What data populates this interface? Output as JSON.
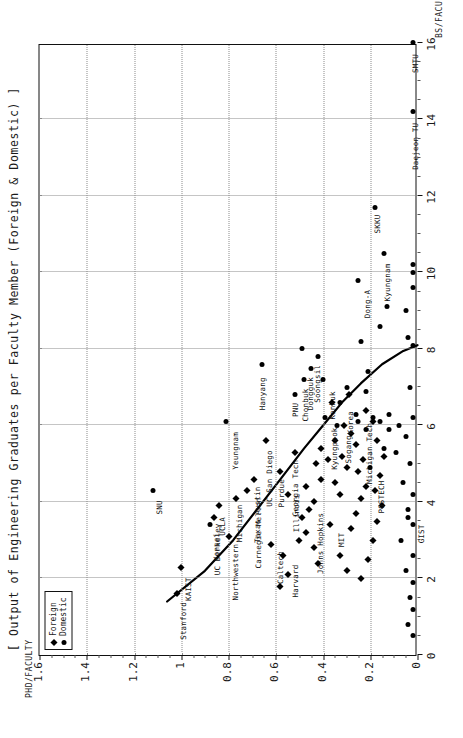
{
  "title": "[ Output of Engineering Graduates per Faculty Member (Foreign & Domestic) ]",
  "legend": {
    "position": "top-left",
    "items": [
      {
        "label": "Foreign",
        "marker": "diamond"
      },
      {
        "label": "Domestic",
        "marker": "circle"
      }
    ]
  },
  "axes": {
    "x_title": "BS/FACULTY",
    "y_title": "PHD/FACULTY",
    "x_ticks": [
      "0",
      "2",
      "4",
      "6",
      "8",
      "10",
      "12",
      "14",
      "16"
    ],
    "y_ticks": [
      "0",
      "0.2",
      "0.4",
      "0.6",
      "0.8",
      "1",
      "1.2",
      "1.4",
      "1.6"
    ]
  },
  "chart_data": {
    "type": "scatter",
    "title": "[ Output of Engineering Graduates per Faculty Member (Foreign & Domestic) ]",
    "xlabel": "BS/FACULTY",
    "ylabel": "PHD/FACULTY",
    "xlim": [
      0,
      16
    ],
    "ylim": [
      0,
      1.6
    ],
    "grid": true,
    "legend_position": "top-left",
    "series": [
      {
        "name": "Foreign",
        "marker": "diamond",
        "points": [
          {
            "label": "Stanford",
            "x": 1.6,
            "y": 1.02
          },
          {
            "label": "KAIST",
            "x": 2.3,
            "y": 1.0
          },
          {
            "label": "Northwestern",
            "x": 3.1,
            "y": 0.8
          },
          {
            "label": "UC Berkeley",
            "x": 3.6,
            "y": 0.86
          },
          {
            "label": "UCLA",
            "x": 3.9,
            "y": 0.84
          },
          {
            "label": "Michigan",
            "x": 4.1,
            "y": 0.77
          },
          {
            "label": "Carnegie Mellon",
            "x": 4.3,
            "y": 0.72
          },
          {
            "label": "Caltech",
            "x": 2.9,
            "y": 0.62
          },
          {
            "label": "Harvard",
            "x": 2.6,
            "y": 0.57
          },
          {
            "label": "Texas Austin",
            "x": 4.6,
            "y": 0.69
          },
          {
            "label": "Illinois",
            "x": 4.2,
            "y": 0.55
          },
          {
            "label": "Purdue",
            "x": 4.8,
            "y": 0.58
          },
          {
            "label": "Georgia Tech",
            "x": 5.3,
            "y": 0.52
          },
          {
            "label": "Johns Hopkins",
            "x": 4.0,
            "y": 0.44
          },
          {
            "label": "MIT",
            "x": 3.4,
            "y": 0.37
          },
          {
            "label": "UC San Diego",
            "x": 5.6,
            "y": 0.64
          },
          {
            "label": "",
            "x": 3.0,
            "y": 0.5
          },
          {
            "label": "",
            "x": 3.2,
            "y": 0.47
          },
          {
            "label": "",
            "x": 3.6,
            "y": 0.49
          },
          {
            "label": "",
            "x": 3.8,
            "y": 0.46
          },
          {
            "label": "",
            "x": 4.4,
            "y": 0.47
          },
          {
            "label": "",
            "x": 4.6,
            "y": 0.41
          },
          {
            "label": "",
            "x": 5.0,
            "y": 0.43
          },
          {
            "label": "",
            "x": 5.1,
            "y": 0.38
          },
          {
            "label": "",
            "x": 5.4,
            "y": 0.41
          },
          {
            "label": "",
            "x": 4.2,
            "y": 0.33
          },
          {
            "label": "",
            "x": 4.5,
            "y": 0.35
          },
          {
            "label": "",
            "x": 4.9,
            "y": 0.3
          },
          {
            "label": "",
            "x": 5.2,
            "y": 0.32
          },
          {
            "label": "",
            "x": 5.6,
            "y": 0.35
          },
          {
            "label": "",
            "x": 2.8,
            "y": 0.44
          },
          {
            "label": "",
            "x": 2.4,
            "y": 0.42
          },
          {
            "label": "",
            "x": 3.3,
            "y": 0.28
          },
          {
            "label": "",
            "x": 3.7,
            "y": 0.26
          },
          {
            "label": "",
            "x": 4.1,
            "y": 0.24
          },
          {
            "label": "",
            "x": 4.4,
            "y": 0.22
          },
          {
            "label": "",
            "x": 4.8,
            "y": 0.25
          },
          {
            "label": "",
            "x": 5.1,
            "y": 0.23
          },
          {
            "label": "",
            "x": 5.5,
            "y": 0.26
          },
          {
            "label": "",
            "x": 5.8,
            "y": 0.28
          },
          {
            "label": "",
            "x": 6.0,
            "y": 0.31
          },
          {
            "label": "",
            "x": 2.2,
            "y": 0.3
          },
          {
            "label": "",
            "x": 2.6,
            "y": 0.33
          },
          {
            "label": "",
            "x": 2.0,
            "y": 0.24
          },
          {
            "label": "",
            "x": 2.5,
            "y": 0.21
          },
          {
            "label": "",
            "x": 3.0,
            "y": 0.19
          },
          {
            "label": "",
            "x": 3.5,
            "y": 0.17
          },
          {
            "label": "",
            "x": 3.9,
            "y": 0.15
          },
          {
            "label": "",
            "x": 4.3,
            "y": 0.18
          },
          {
            "label": "",
            "x": 4.7,
            "y": 0.16
          },
          {
            "label": "",
            "x": 5.2,
            "y": 0.14
          },
          {
            "label": "",
            "x": 5.6,
            "y": 0.17
          },
          {
            "label": "",
            "x": 6.1,
            "y": 0.19
          },
          {
            "label": "",
            "x": 6.4,
            "y": 0.22
          },
          {
            "label": "",
            "x": 1.8,
            "y": 0.58
          },
          {
            "label": "",
            "x": 2.1,
            "y": 0.55
          },
          {
            "label": "",
            "x": 6.6,
            "y": 0.36
          },
          {
            "label": "",
            "x": 6.8,
            "y": 0.29
          }
        ]
      },
      {
        "name": "Domestic",
        "marker": "circle",
        "points": [
          {
            "label": "SNU",
            "x": 4.3,
            "y": 1.12
          },
          {
            "label": "Yonsei",
            "x": 3.4,
            "y": 0.88
          },
          {
            "label": "Yeungnam",
            "x": 6.1,
            "y": 0.81
          },
          {
            "label": "Hanyang",
            "x": 7.6,
            "y": 0.66
          },
          {
            "label": "PNU",
            "x": 6.8,
            "y": 0.52
          },
          {
            "label": "Chonbuk",
            "x": 7.2,
            "y": 0.48
          },
          {
            "label": "Dongguk",
            "x": 7.5,
            "y": 0.45
          },
          {
            "label": "Soongsil",
            "x": 7.8,
            "y": 0.42
          },
          {
            "label": "Konkuk",
            "x": 7.2,
            "y": 0.4
          },
          {
            "label": "Kyungpook",
            "x": 6.2,
            "y": 0.39
          },
          {
            "label": "Sogang",
            "x": 6.0,
            "y": 0.34
          },
          {
            "label": "Korea",
            "x": 6.6,
            "y": 0.33
          },
          {
            "label": "Michigan Tech",
            "x": 6.3,
            "y": 0.26
          },
          {
            "label": "SKKU",
            "x": 11.7,
            "y": 0.18
          },
          {
            "label": "Dong-A",
            "x": 9.8,
            "y": 0.25
          },
          {
            "label": "Kyungnam",
            "x": 10.5,
            "y": 0.14
          },
          {
            "label": "Daejeon TU",
            "x": 14.2,
            "y": 0.02
          },
          {
            "label": "SMTU",
            "x": 16.0,
            "y": 0.02
          },
          {
            "label": "",
            "x": 8.0,
            "y": 0.49
          },
          {
            "label": "",
            "x": 7.0,
            "y": 0.3
          },
          {
            "label": "",
            "x": 6.9,
            "y": 0.22
          },
          {
            "label": "",
            "x": 7.4,
            "y": 0.21
          },
          {
            "label": "",
            "x": 8.2,
            "y": 0.24
          },
          {
            "label": "",
            "x": 8.6,
            "y": 0.16
          },
          {
            "label": "",
            "x": 9.1,
            "y": 0.13
          },
          {
            "label": "",
            "x": 9.0,
            "y": 0.05
          },
          {
            "label": "",
            "x": 8.3,
            "y": 0.04
          },
          {
            "label": "",
            "x": 7.0,
            "y": 0.03
          },
          {
            "label": "",
            "x": 6.2,
            "y": 0.02
          },
          {
            "label": "",
            "x": 6.0,
            "y": 0.08
          },
          {
            "label": "",
            "x": 5.9,
            "y": 0.12
          },
          {
            "label": "",
            "x": 5.7,
            "y": 0.05
          },
          {
            "label": "",
            "x": 5.3,
            "y": 0.09
          },
          {
            "label": "",
            "x": 5.0,
            "y": 0.03
          },
          {
            "label": "",
            "x": 4.5,
            "y": 0.06
          },
          {
            "label": "",
            "x": 4.2,
            "y": 0.02
          },
          {
            "label": "",
            "x": 3.8,
            "y": 0.04
          },
          {
            "label": "",
            "x": 3.4,
            "y": 0.02
          },
          {
            "label": "",
            "x": 3.0,
            "y": 0.07
          },
          {
            "label": "",
            "x": 2.6,
            "y": 0.02
          },
          {
            "label": "",
            "x": 2.2,
            "y": 0.05
          },
          {
            "label": "",
            "x": 1.9,
            "y": 0.02
          },
          {
            "label": "",
            "x": 1.5,
            "y": 0.03
          },
          {
            "label": "",
            "x": 1.2,
            "y": 0.02
          },
          {
            "label": "",
            "x": 0.8,
            "y": 0.04
          },
          {
            "label": "",
            "x": 0.5,
            "y": 0.02
          },
          {
            "label": "",
            "x": 10.0,
            "y": 0.02
          },
          {
            "label": "",
            "x": 10.2,
            "y": 0.02
          },
          {
            "label": "",
            "x": 9.6,
            "y": 0.02
          },
          {
            "label": "",
            "x": 8.1,
            "y": 0.02
          },
          {
            "label": "",
            "x": 6.1,
            "y": 0.16
          },
          {
            "label": "",
            "x": 6.3,
            "y": 0.12
          },
          {
            "label": "",
            "x": 6.2,
            "y": 0.19
          },
          {
            "label": "",
            "x": 5.9,
            "y": 0.22
          },
          {
            "label": "",
            "x": 6.1,
            "y": 0.25
          },
          {
            "label": "",
            "x": 5.4,
            "y": 0.14
          }
        ]
      }
    ],
    "trend_curve": {
      "name": "fitted-trend",
      "points": [
        {
          "x": 1.4,
          "y": 1.06
        },
        {
          "x": 2.2,
          "y": 0.9
        },
        {
          "x": 3.0,
          "y": 0.78
        },
        {
          "x": 3.8,
          "y": 0.68
        },
        {
          "x": 4.6,
          "y": 0.58
        },
        {
          "x": 5.4,
          "y": 0.48
        },
        {
          "x": 6.0,
          "y": 0.4
        },
        {
          "x": 6.6,
          "y": 0.32
        },
        {
          "x": 7.1,
          "y": 0.24
        },
        {
          "x": 7.6,
          "y": 0.15
        },
        {
          "x": 7.95,
          "y": 0.06
        },
        {
          "x": 8.1,
          "y": 0.0
        }
      ]
    },
    "point_labels": [
      "Stanford",
      "KAIST",
      "Yonsei",
      "SNU",
      "Northwestern",
      "UC Berkeley",
      "UCLA",
      "Michigan",
      "Carnegie Mellon",
      "Caltech",
      "Harvard",
      "Texas Austin",
      "Illinois",
      "Purdue",
      "Georgia Tech",
      "Johns Hopkins",
      "MIT",
      "POSTECH",
      "GIST",
      "UC San Diego",
      "Yeungnam",
      "Hanyang",
      "PNU",
      "Chonbuk",
      "Dongguk",
      "Soongsil",
      "Konkuk",
      "Kyungpook",
      "Sogang",
      "Korea",
      "Michigan Tech",
      "SKKU",
      "Dong-A",
      "Kyungnam",
      "Daejeon TU",
      "SMTU"
    ]
  }
}
